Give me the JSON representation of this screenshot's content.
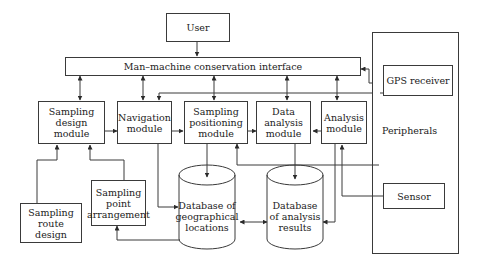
{
  "diagram": {
    "nodes": {
      "user": "User",
      "interface": "Man–machine conservation interface",
      "gps": "GPS receiver",
      "peripherals": "Peripherals",
      "sensor": "Sensor",
      "sampling_design": "Sampling design module",
      "navigation": "Navigation module",
      "sampling_positioning": "Sampling positioning module",
      "data_analysis": "Data analysis module",
      "analysis": "Analysis module",
      "sampling_route": "Sampling route design",
      "sampling_point": "Sampling point arrangement",
      "db_geo": "Database of geographical locations",
      "db_analysis": "Database of analysis results"
    },
    "edges": [
      {
        "from": "User",
        "to": "Man–machine conservation interface"
      },
      {
        "from": "GPS receiver",
        "to": "Man–machine conservation interface"
      },
      {
        "from": "Man–machine conservation interface",
        "to": "Sampling design module",
        "bidirectional": true
      },
      {
        "from": "Man–machine conservation interface",
        "to": "Navigation module",
        "bidirectional": true
      },
      {
        "from": "Man–machine conservation interface",
        "to": "Sampling positioning module",
        "bidirectional": true
      },
      {
        "from": "Man–machine conservation interface",
        "to": "Data analysis module",
        "bidirectional": true
      },
      {
        "from": "Man–machine conservation interface",
        "to": "Analysis module",
        "bidirectional": true
      },
      {
        "from": "GPS receiver",
        "to": "Navigation module"
      },
      {
        "from": "GPS receiver",
        "to": "Sampling positioning module"
      },
      {
        "from": "Sampling design module",
        "to": "Navigation module"
      },
      {
        "from": "Navigation module",
        "to": "Sampling positioning module"
      },
      {
        "from": "Sampling positioning module",
        "to": "Data analysis module"
      },
      {
        "from": "Analysis module",
        "to": "Data analysis module"
      },
      {
        "from": "Sampling route design",
        "to": "Sampling design module"
      },
      {
        "from": "Sampling point arrangement",
        "to": "Sampling design module"
      },
      {
        "from": "Navigation module",
        "to": "Database of geographical locations"
      },
      {
        "from": "Sampling positioning module",
        "to": "Database of geographical locations"
      },
      {
        "from": "Database of geographical locations",
        "to": "Sampling point arrangement"
      },
      {
        "from": "Database of geographical locations",
        "to": "Database of analysis results",
        "bidirectional": true
      },
      {
        "from": "Data analysis module",
        "to": "Database of analysis results"
      },
      {
        "from": "Peripherals",
        "to": "Sampling positioning module"
      },
      {
        "from": "Analysis module",
        "to": "Database of analysis results"
      },
      {
        "from": "Sensor",
        "to": "Analysis module"
      }
    ]
  }
}
